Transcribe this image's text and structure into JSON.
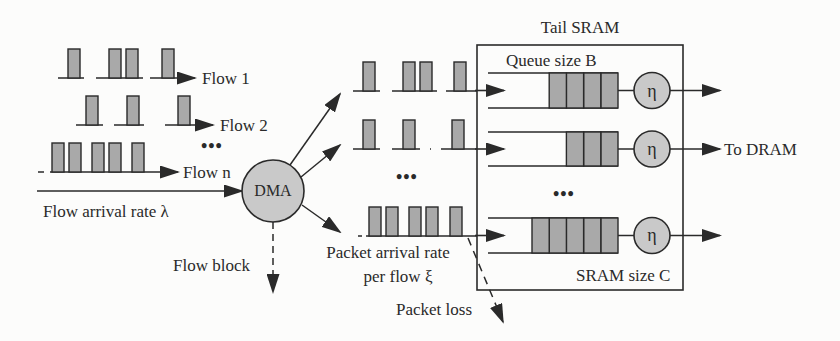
{
  "diagram": {
    "colors": {
      "stroke": "#2a2a2a",
      "packet_fill": "#a9a9a9",
      "circle_fill": "#c9c9c9",
      "background": "#fcfcfb"
    },
    "input_flows": [
      {
        "label": "Flow 1",
        "baseline_y": 78,
        "top_y": 49,
        "start_x": 58,
        "end_x": 195,
        "pulses": [
          68,
          109,
          126,
          162
        ],
        "gaps": [
          [
            84,
            96
          ],
          [
            143,
            150
          ]
        ]
      },
      {
        "label": "Flow 2",
        "baseline_y": 125,
        "top_y": 96,
        "start_x": 76,
        "end_x": 213,
        "pulses": [
          86,
          127,
          178
        ],
        "gaps": [
          [
            103,
            114
          ],
          [
            144,
            165
          ]
        ]
      },
      {
        "label": "Flow n",
        "baseline_y": 172,
        "top_y": 143,
        "start_x": 38,
        "end_x": 178,
        "pulses": [
          52,
          69,
          92,
          109,
          132
        ],
        "gaps": [
          [
            44,
            50
          ]
        ]
      }
    ],
    "input_dots": "•••",
    "flow_arrival_label": "Flow arrival rate λ",
    "dma": {
      "label": "DMA",
      "cx": 273,
      "cy": 191,
      "r": 31
    },
    "flow_block_label": "Flow block",
    "output_flows": [
      {
        "baseline_y": 91,
        "top_y": 62,
        "start_x": 353,
        "pulses": [
          363,
          403,
          420,
          454
        ],
        "gaps": [
          [
            380,
            392
          ],
          [
            437,
            446
          ]
        ]
      },
      {
        "baseline_y": 149,
        "top_y": 120,
        "start_x": 353,
        "pulses": [
          363,
          403,
          452
        ],
        "gaps": [
          [
            380,
            392
          ],
          [
            420,
            430
          ],
          [
            431,
            441
          ]
        ]
      },
      {
        "baseline_y": 236,
        "top_y": 207,
        "start_x": 358,
        "pulses": [
          369,
          386,
          409,
          426,
          450
        ],
        "gaps": [
          [
            362,
            366
          ]
        ]
      }
    ],
    "output_dots": "•••",
    "packet_arrival_label_line1": "Packet arrival rate",
    "packet_arrival_label_line2": "per flow ξ",
    "packet_loss_label": "Packet loss",
    "tail_sram": {
      "title": "Tail SRAM",
      "queue_size_label": "Queue size B",
      "sram_size_label": "SRAM size C",
      "box": {
        "x": 477,
        "y": 45,
        "w": 206,
        "h": 245
      },
      "queues": [
        {
          "top": 73,
          "bottom": 108,
          "cells": 4,
          "server": "η"
        },
        {
          "top": 132,
          "bottom": 166,
          "cells": 3,
          "server": "η"
        },
        {
          "top": 218,
          "bottom": 253,
          "cells": 5,
          "server": "η"
        }
      ],
      "queue_dots": "•••"
    },
    "to_dram_label": "To DRAM"
  }
}
